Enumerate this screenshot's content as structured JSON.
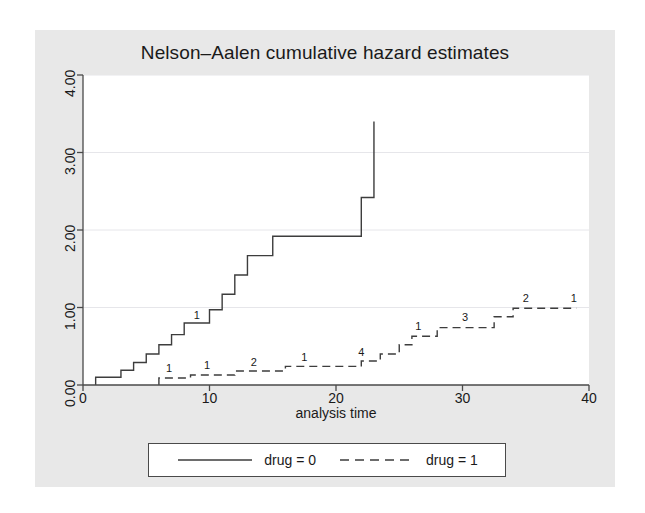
{
  "chart_data": {
    "type": "line",
    "title": "Nelson–Aalen cumulative hazard estimates",
    "xlabel": "analysis time",
    "ylabel": "",
    "xlim": [
      0,
      40
    ],
    "ylim": [
      0,
      4.0
    ],
    "xticks": [
      "0",
      "10",
      "20",
      "30",
      "40"
    ],
    "xtick_values": [
      0,
      10,
      20,
      30,
      40
    ],
    "yticks": [
      "0.00",
      "1.00",
      "2.00",
      "3.00",
      "4.00"
    ],
    "ytick_values": [
      0,
      1,
      2,
      3,
      4
    ],
    "grid": "horizontal",
    "legend_position": "below-plot",
    "series": [
      {
        "name": "drug = 0",
        "style": "solid",
        "color": "#3d3d3d",
        "points": [
          [
            1.0,
            0.0
          ],
          [
            1.0,
            0.1
          ],
          [
            3.0,
            0.1
          ],
          [
            3.0,
            0.19
          ],
          [
            4.0,
            0.19
          ],
          [
            4.0,
            0.29
          ],
          [
            5.0,
            0.29
          ],
          [
            5.0,
            0.4
          ],
          [
            6.0,
            0.4
          ],
          [
            6.0,
            0.52
          ],
          [
            7.0,
            0.52
          ],
          [
            7.0,
            0.65
          ],
          [
            8.0,
            0.65
          ],
          [
            8.0,
            0.8
          ],
          [
            10.0,
            0.8
          ],
          [
            10.0,
            0.97
          ],
          [
            11.0,
            0.97
          ],
          [
            11.0,
            1.17
          ],
          [
            12.0,
            1.17
          ],
          [
            12.0,
            1.42
          ],
          [
            13.0,
            1.42
          ],
          [
            13.0,
            1.67
          ],
          [
            15.0,
            1.67
          ],
          [
            15.0,
            1.92
          ],
          [
            17.0,
            1.92
          ],
          [
            17.0,
            1.92
          ],
          [
            22.0,
            1.92
          ],
          [
            22.0,
            2.42
          ],
          [
            23.0,
            2.42
          ],
          [
            23.0,
            3.4
          ]
        ],
        "censor_labels": [
          {
            "x": 9.0,
            "y": 0.8,
            "text": "1"
          }
        ]
      },
      {
        "name": "drug = 1",
        "style": "dashed",
        "color": "#3d3d3d",
        "points": [
          [
            6.0,
            0.0
          ],
          [
            6.0,
            0.09
          ],
          [
            8.5,
            0.09
          ],
          [
            8.5,
            0.13
          ],
          [
            12.0,
            0.13
          ],
          [
            12.0,
            0.18
          ],
          [
            16.0,
            0.18
          ],
          [
            16.0,
            0.24
          ],
          [
            22.0,
            0.24
          ],
          [
            22.0,
            0.31
          ],
          [
            23.5,
            0.31
          ],
          [
            23.5,
            0.4
          ],
          [
            25.0,
            0.4
          ],
          [
            25.0,
            0.52
          ],
          [
            26.0,
            0.52
          ],
          [
            26.0,
            0.63
          ],
          [
            28.0,
            0.63
          ],
          [
            28.0,
            0.74
          ],
          [
            32.5,
            0.74
          ],
          [
            32.5,
            0.88
          ],
          [
            34.0,
            0.88
          ],
          [
            34.0,
            0.99
          ],
          [
            39.0,
            0.99
          ]
        ],
        "censor_labels": [
          {
            "x": 6.8,
            "y": 0.11,
            "text": "1"
          },
          {
            "x": 9.8,
            "y": 0.15,
            "text": "1"
          },
          {
            "x": 13.5,
            "y": 0.2,
            "text": "2"
          },
          {
            "x": 17.5,
            "y": 0.26,
            "text": "1"
          },
          {
            "x": 22.0,
            "y": 0.32,
            "text": "4"
          },
          {
            "x": 26.5,
            "y": 0.66,
            "text": "1"
          },
          {
            "x": 30.2,
            "y": 0.77,
            "text": "3"
          },
          {
            "x": 35.0,
            "y": 1.02,
            "text": "2"
          },
          {
            "x": 38.8,
            "y": 1.02,
            "text": "1"
          }
        ]
      }
    ]
  },
  "legend": {
    "entries": [
      {
        "label": "drug = 0",
        "style": "solid"
      },
      {
        "label": "drug = 1",
        "style": "dashed"
      }
    ]
  },
  "colors": {
    "panel_background": "#e8e8e8",
    "plot_background": "#ffffff",
    "line": "#3d3d3d",
    "grid": "#e6e6ea",
    "axis": "#4a4a4a",
    "text": "#1a1a1a"
  }
}
